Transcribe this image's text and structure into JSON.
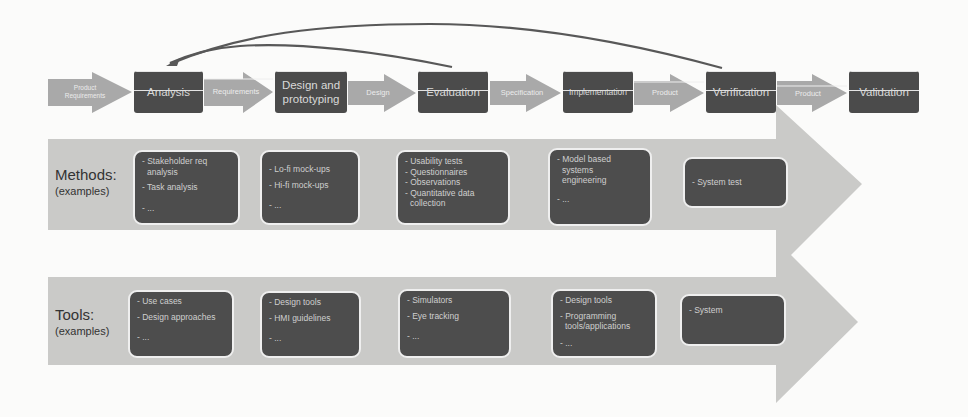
{
  "process": {
    "steps": [
      {
        "label": "Analysis"
      },
      {
        "label": "Design and prototyping"
      },
      {
        "label": "Evaluation"
      },
      {
        "label": "Implementation"
      },
      {
        "label": "Verification"
      },
      {
        "label": "Validation"
      }
    ],
    "connectors": [
      {
        "label": "Product Requirements"
      },
      {
        "label": "Requirements"
      },
      {
        "label": "Design"
      },
      {
        "label": "Specification"
      },
      {
        "label": "Product"
      },
      {
        "label": "Product"
      }
    ],
    "feedback_arrows": [
      {
        "from": "Evaluation",
        "to": "Analysis"
      },
      {
        "from": "Verification",
        "to": "Analysis"
      }
    ]
  },
  "methods": {
    "label": "Methods:",
    "sublabel": "(examples)",
    "cards": [
      {
        "lines": [
          "- Stakeholder req",
          "  analysis",
          "- Task analysis",
          "- ..."
        ]
      },
      {
        "lines": [
          "- Lo-fi mock-ups",
          "- Hi-fi mock-ups",
          "- ..."
        ]
      },
      {
        "lines": [
          "- Usability tests",
          "- Questionnaires",
          "- Observations",
          "- Quantitative data",
          "  collection"
        ]
      },
      {
        "lines": [
          "- Model based",
          "  systems",
          "  engineering",
          "- ..."
        ]
      },
      {
        "lines": [
          "- System test"
        ]
      }
    ]
  },
  "tools": {
    "label": "Tools:",
    "sublabel": "(examples)",
    "cards": [
      {
        "lines": [
          "- Use cases",
          "- Design approaches",
          "- ..."
        ]
      },
      {
        "lines": [
          "- Design tools",
          "- HMI guidelines",
          "- ..."
        ]
      },
      {
        "lines": [
          "- Simulators",
          "- Eye tracking",
          "- ..."
        ]
      },
      {
        "lines": [
          "- Design tools",
          "- Programming",
          "  tools/applications",
          "- ..."
        ]
      },
      {
        "lines": [
          "- System"
        ]
      }
    ]
  },
  "colors": {
    "process_box": "#4b4b4b",
    "connector_arrow": "#a9a9a9",
    "band_arrow": "#c9c9c7",
    "card": "#4d4d4d",
    "feedback_line": "#555555"
  }
}
